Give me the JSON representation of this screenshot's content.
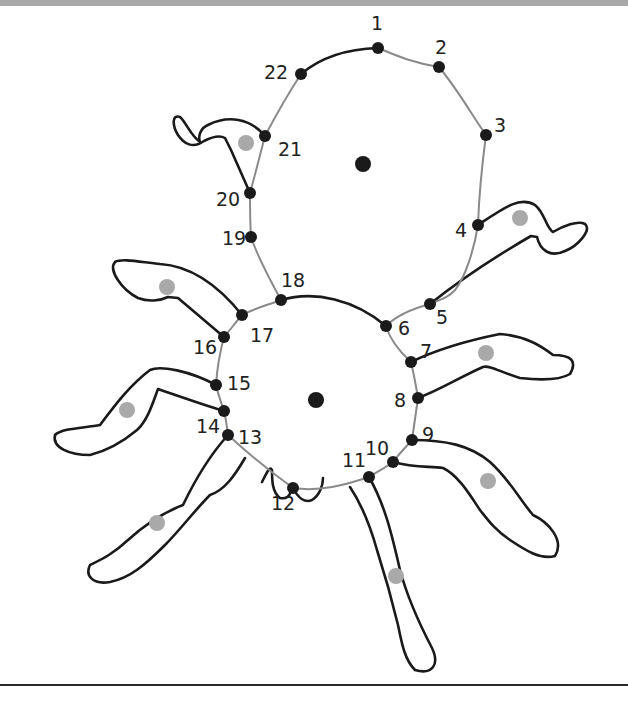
{
  "worksheet": {
    "type": "connect-the-dots",
    "subject": "spider",
    "colors": {
      "dot": "#1a1a1a",
      "guide_line": "#8a8a8a",
      "outline": "#1a1a1a",
      "leg_marker": "#a9a9a9",
      "header_bar": "#a9a9a9"
    },
    "dots": [
      {
        "n": "1",
        "x": 378,
        "y": 48
      },
      {
        "n": "2",
        "x": 439,
        "y": 67
      },
      {
        "n": "3",
        "x": 486,
        "y": 135
      },
      {
        "n": "4",
        "x": 478,
        "y": 225
      },
      {
        "n": "5",
        "x": 430,
        "y": 304
      },
      {
        "n": "6",
        "x": 386,
        "y": 326
      },
      {
        "n": "7",
        "x": 411,
        "y": 362
      },
      {
        "n": "8",
        "x": 418,
        "y": 398
      },
      {
        "n": "9",
        "x": 412,
        "y": 440
      },
      {
        "n": "10",
        "x": 393,
        "y": 462
      },
      {
        "n": "11",
        "x": 369,
        "y": 477
      },
      {
        "n": "12",
        "x": 293,
        "y": 488
      },
      {
        "n": "13",
        "x": 228,
        "y": 435
      },
      {
        "n": "14",
        "x": 224,
        "y": 411
      },
      {
        "n": "15",
        "x": 216,
        "y": 385
      },
      {
        "n": "16",
        "x": 224,
        "y": 337
      },
      {
        "n": "17",
        "x": 242,
        "y": 315
      },
      {
        "n": "18",
        "x": 281,
        "y": 300
      },
      {
        "n": "19",
        "x": 251,
        "y": 237
      },
      {
        "n": "20",
        "x": 250,
        "y": 193
      },
      {
        "n": "21",
        "x": 265,
        "y": 136
      },
      {
        "n": "22",
        "x": 301,
        "y": 74
      }
    ],
    "labels": [
      {
        "text": "1",
        "x": 371,
        "y": 30
      },
      {
        "text": "2",
        "x": 435,
        "y": 54
      },
      {
        "text": "3",
        "x": 494,
        "y": 132
      },
      {
        "text": "4",
        "x": 455,
        "y": 237
      },
      {
        "text": "5",
        "x": 436,
        "y": 324
      },
      {
        "text": "6",
        "x": 398,
        "y": 335
      },
      {
        "text": "7",
        "x": 420,
        "y": 358
      },
      {
        "text": "8",
        "x": 394,
        "y": 407
      },
      {
        "text": "9",
        "x": 422,
        "y": 441
      },
      {
        "text": "10",
        "x": 365,
        "y": 455
      },
      {
        "text": "11",
        "x": 342,
        "y": 467
      },
      {
        "text": "12",
        "x": 271,
        "y": 510
      },
      {
        "text": "13",
        "x": 238,
        "y": 444
      },
      {
        "text": "14",
        "x": 196,
        "y": 433
      },
      {
        "text": "15",
        "x": 227,
        "y": 390
      },
      {
        "text": "16",
        "x": 193,
        "y": 354
      },
      {
        "text": "17",
        "x": 250,
        "y": 342
      },
      {
        "text": "18",
        "x": 281,
        "y": 287
      },
      {
        "text": "19",
        "x": 222,
        "y": 245
      },
      {
        "text": "20",
        "x": 216,
        "y": 206
      },
      {
        "text": "21",
        "x": 278,
        "y": 156
      },
      {
        "text": "22",
        "x": 264,
        "y": 79
      }
    ],
    "center_dots": [
      {
        "name": "head-center-dot",
        "x": 363,
        "y": 164
      },
      {
        "name": "body-center-dot",
        "x": 316,
        "y": 400
      }
    ],
    "leg_markers": [
      {
        "x": 246,
        "y": 143
      },
      {
        "x": 520,
        "y": 218
      },
      {
        "x": 167,
        "y": 287
      },
      {
        "x": 486,
        "y": 353
      },
      {
        "x": 127,
        "y": 410
      },
      {
        "x": 488,
        "y": 481
      },
      {
        "x": 157,
        "y": 523
      },
      {
        "x": 396,
        "y": 576
      }
    ]
  }
}
